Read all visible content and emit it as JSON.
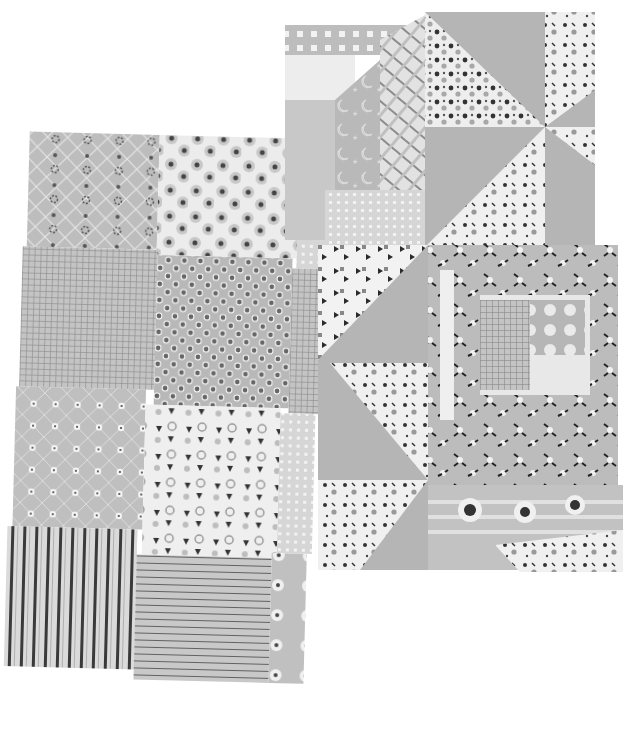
{
  "scene": {
    "description": "Photograph (grayscale) of two pinked-edge patchwork fabric swatches on white background",
    "left_swatch": {
      "patches": [
        {
          "pattern": "diamond lattice with dotted vertical stripes",
          "tone": "#bdbdbd"
        },
        {
          "pattern": "white with gray flower rosettes",
          "tone": "#ececec"
        },
        {
          "pattern": "fine grid check",
          "tone": "#c2c2c2"
        },
        {
          "pattern": "gray with dark polka dots",
          "tone": "#b8b8b8"
        },
        {
          "pattern": "diamond lattice with small white flowers",
          "tone": "#bfbfbf"
        },
        {
          "pattern": "white with dark tulip sprigs",
          "tone": "#efefef"
        },
        {
          "pattern": "dark vertical stripes",
          "tone": "#d4d4d4"
        },
        {
          "pattern": "thin horizontal stripes",
          "tone": "#c6c6c6"
        }
      ]
    },
    "right_swatch": {
      "patches": [
        {
          "pattern": "gingham checks",
          "tone": "#bdbdbd"
        },
        {
          "pattern": "pinwheel triangles solid gray",
          "tone": "#b5b5b5"
        },
        {
          "pattern": "polka dot triangles",
          "tone": "#ededed"
        },
        {
          "pattern": "diagonal plaid strip",
          "tone": "#d8d8d8"
        },
        {
          "pattern": "moons and stars",
          "tone": "#b9b9b9"
        },
        {
          "pattern": "floral log cabin block",
          "tone": "#bcbcbc"
        },
        {
          "pattern": "white with dark florals",
          "tone": "#f0f0f0"
        }
      ]
    }
  }
}
